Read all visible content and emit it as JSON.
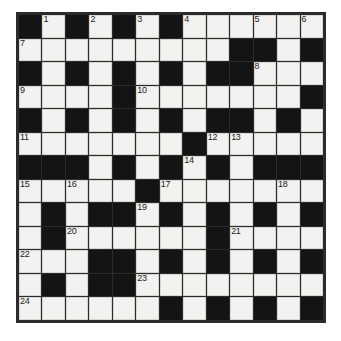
{
  "puzzle": {
    "type": "crossword-grid",
    "title": "",
    "rows": 13,
    "columns": 13,
    "colors": {
      "block": "#141414",
      "open": "#f2f2f0",
      "border": "#2b2b2b",
      "number": "#1a1a1a",
      "page_background": "#ffffff"
    },
    "legend": {
      "block_char": "#",
      "open_char": "."
    },
    "grid": [
      "#.#.#.#......",
      ".........##.#",
      "#.#.#.#.##...",
      "....#.......#",
      "#.#.#.#.##.#.",
      ".......#.....",
      "###.#.#.#.###",
      ".....#.......",
      ".#.##.#.#.#.#",
      ".#......#....",
      "...##.#.#.#.#",
      ".#.##........",
      "......#.#.#.#"
    ],
    "numbers": [
      {
        "label": "1",
        "row": 1,
        "col": 2
      },
      {
        "label": "2",
        "row": 1,
        "col": 4
      },
      {
        "label": "3",
        "row": 1,
        "col": 6
      },
      {
        "label": "4",
        "row": 1,
        "col": 8
      },
      {
        "label": "5",
        "row": 1,
        "col": 11
      },
      {
        "label": "6",
        "row": 1,
        "col": 13
      },
      {
        "label": "7",
        "row": 2,
        "col": 1
      },
      {
        "label": "8",
        "row": 3,
        "col": 11
      },
      {
        "label": "9",
        "row": 4,
        "col": 1
      },
      {
        "label": "10",
        "row": 4,
        "col": 6
      },
      {
        "label": "11",
        "row": 6,
        "col": 1
      },
      {
        "label": "12",
        "row": 6,
        "col": 9
      },
      {
        "label": "13",
        "row": 6,
        "col": 10
      },
      {
        "label": "14",
        "row": 7,
        "col": 8
      },
      {
        "label": "15",
        "row": 8,
        "col": 1
      },
      {
        "label": "16",
        "row": 8,
        "col": 3
      },
      {
        "label": "17",
        "row": 8,
        "col": 7
      },
      {
        "label": "18",
        "row": 8,
        "col": 12
      },
      {
        "label": "19",
        "row": 9,
        "col": 6
      },
      {
        "label": "20",
        "row": 10,
        "col": 3
      },
      {
        "label": "21",
        "row": 10,
        "col": 10
      },
      {
        "label": "22",
        "row": 11,
        "col": 1
      },
      {
        "label": "23",
        "row": 12,
        "col": 6
      },
      {
        "label": "24",
        "row": 13,
        "col": 1
      }
    ],
    "entries": {
      "across": [
        "1",
        "2",
        "3",
        "4",
        "5",
        "6",
        "7",
        "8",
        "9",
        "10",
        "11",
        "12",
        "14",
        "15",
        "17",
        "19",
        "20",
        "21",
        "22",
        "23",
        "24"
      ],
      "down": [
        "1",
        "2",
        "3",
        "4",
        "5",
        "6",
        "8",
        "12",
        "13",
        "15",
        "16",
        "17",
        "18",
        "20",
        "21"
      ]
    }
  }
}
